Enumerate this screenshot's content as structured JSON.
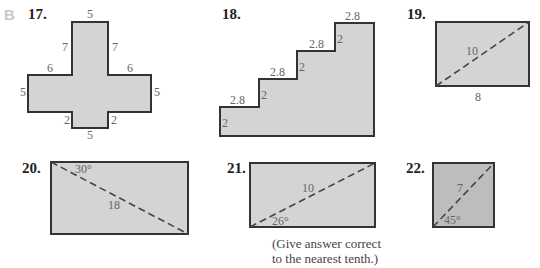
{
  "section_label": "B",
  "problems": [
    {
      "number": "17.",
      "shape": "cross",
      "labels": {
        "top": "5",
        "upper_left": "7",
        "upper_right": "7",
        "left_arm_top": "6",
        "right_arm_top": "6",
        "left": "5",
        "right": "5",
        "lower_left": "2",
        "lower_right": "2",
        "bottom": "5"
      }
    },
    {
      "number": "18.",
      "shape": "staircase",
      "step_width": "2.8",
      "step_height": "2",
      "step_count": 4
    },
    {
      "number": "19.",
      "shape": "rectangle",
      "diagonal": "10",
      "base": "8"
    },
    {
      "number": "20.",
      "shape": "rectangle",
      "angle": "30°",
      "diagonal": "18"
    },
    {
      "number": "21.",
      "shape": "rectangle",
      "diagonal": "10",
      "angle": "26°",
      "note_line1": "(Give answer correct",
      "note_line2": "to the nearest tenth.)"
    },
    {
      "number": "22.",
      "shape": "square",
      "diagonal": "7",
      "angle": "45°"
    }
  ]
}
